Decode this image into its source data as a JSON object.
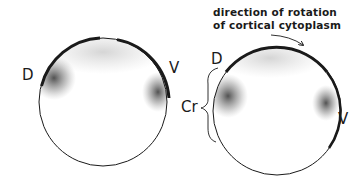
{
  "figure": {
    "left_embryo": {
      "label_dorsal": "D",
      "label_ventral": "V"
    },
    "right_embryo": {
      "label_dorsal": "D",
      "label_ventral": "V",
      "label_crescent": "Cr",
      "caption_line1": "direction of rotation",
      "caption_line2": "of cortical cytoplasm"
    },
    "colors": {
      "ink": "#1a1a1a",
      "stipple": "#555555",
      "background": "#ffffff"
    }
  }
}
